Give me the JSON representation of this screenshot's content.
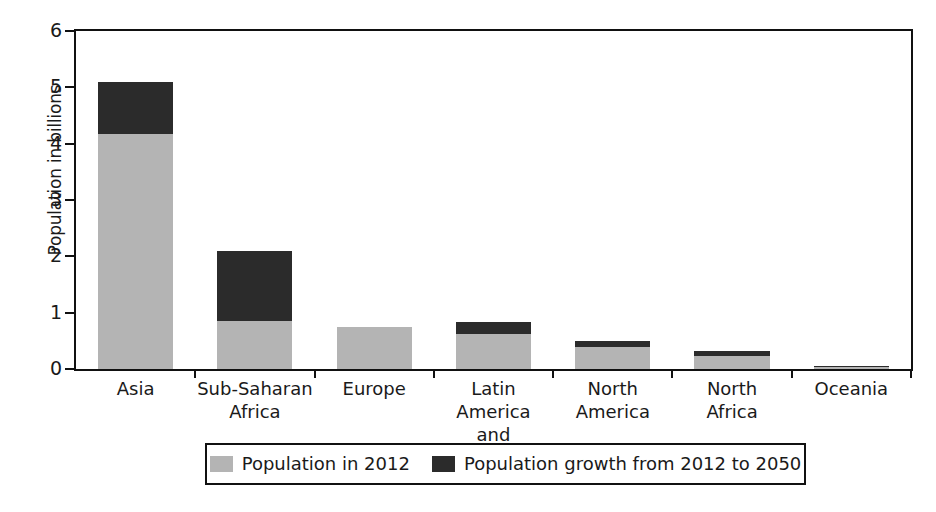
{
  "chart_data": {
    "type": "bar",
    "subtype": "stacked-bar",
    "title": "",
    "xlabel": "",
    "ylabel": "Population in billions",
    "ylim": [
      0,
      6
    ],
    "yticks": [
      0,
      1,
      2,
      3,
      4,
      5,
      6
    ],
    "ytick_labels": [
      "0",
      "1",
      "2",
      "3",
      "4",
      "5",
      "6"
    ],
    "grid": false,
    "legend_position": "bottom-center",
    "categories": [
      "Asia",
      "Sub-Saharan Africa",
      "Europe",
      "Latin America and Caribbean",
      "North America",
      "North Africa",
      "Oceania"
    ],
    "category_lines": [
      [
        "Asia",
        ""
      ],
      [
        "Sub-Saharan",
        "Africa"
      ],
      [
        "Europe",
        ""
      ],
      [
        "Latin America",
        "and Caribbean"
      ],
      [
        "North",
        "America"
      ],
      [
        "North",
        "Africa"
      ],
      [
        "Oceania",
        ""
      ]
    ],
    "series": [
      {
        "name": "Population in 2012",
        "color": "#b4b4b4",
        "values": [
          4.18,
          0.85,
          0.74,
          0.62,
          0.39,
          0.23,
          0.04
        ]
      },
      {
        "name": "Population growth from 2012 to 2050",
        "color": "#2b2b2b",
        "values": [
          0.92,
          1.25,
          0.0,
          0.21,
          0.11,
          0.09,
          0.02
        ]
      }
    ],
    "totals": [
      5.1,
      2.1,
      0.74,
      0.83,
      0.5,
      0.32,
      0.06
    ]
  },
  "legend": {
    "entries": [
      {
        "label": "Population in 2012",
        "swatch": "light-gray-swatch"
      },
      {
        "label": "Population growth from 2012 to 2050",
        "swatch": "dark-gray-swatch"
      }
    ]
  },
  "axes": {
    "y_title": "Population in billions"
  },
  "colors": {
    "population_2012": "#b4b4b4",
    "population_growth": "#2b2b2b",
    "axis": "#111111",
    "background": "#ffffff"
  }
}
